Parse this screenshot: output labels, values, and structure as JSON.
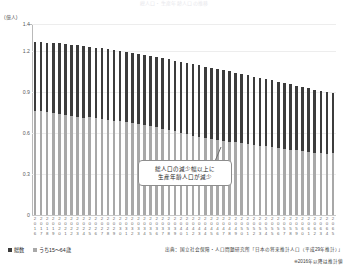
{
  "chart_title": "総人口・生産年齢人口の推移",
  "y_axis_unit": "(億人)",
  "annotation": {
    "line1": "総人口の減少幅以上に",
    "line2": "生産年齢人口が減少"
  },
  "legend": {
    "items": [
      {
        "label": "総数",
        "color": "#3c3c3c"
      },
      {
        "label": "うち15～64歳",
        "color": "#a8a8a8"
      }
    ]
  },
  "source": "出典：国立社会保障・人口問題研究所「日本の将来推計人口（平成29年推計）」",
  "note": "※2016年以降は推計値",
  "chart_data": {
    "type": "bar",
    "title": "総人口・生産年齢人口の推移",
    "xlabel": "",
    "ylabel": "(億人)",
    "ylim": [
      0,
      1.4
    ],
    "yticks": [
      0,
      0.3,
      0.6,
      0.9,
      1.2,
      1.4
    ],
    "ytick_labels": [
      "0",
      "0.3",
      "0.6",
      "0.9",
      "1.2",
      "1.4"
    ],
    "grid": true,
    "legend_position": "bottom-left",
    "categories": [
      "2016",
      "2017",
      "2018",
      "2019",
      "2020",
      "2021",
      "2022",
      "2023",
      "2024",
      "2025",
      "2026",
      "2027",
      "2028",
      "2029",
      "2030",
      "2031",
      "2032",
      "2033",
      "2034",
      "2035",
      "2036",
      "2037",
      "2038",
      "2039",
      "2040",
      "2041",
      "2042",
      "2043",
      "2044",
      "2045",
      "2046",
      "2047",
      "2048",
      "2049",
      "2050",
      "2051",
      "2052",
      "2053",
      "2054",
      "2055",
      "2056",
      "2057",
      "2058",
      "2059",
      "2060",
      "2061",
      "2062",
      "2063",
      "2064",
      "2065"
    ],
    "series": [
      {
        "name": "総数",
        "color": "#3c3c3c",
        "values": [
          1.2693,
          1.2671,
          1.2644,
          1.2612,
          1.2573,
          1.253,
          1.2484,
          1.2434,
          1.2381,
          1.2326,
          1.2268,
          1.2208,
          1.2145,
          1.208,
          1.2012,
          1.1942,
          1.187,
          1.1796,
          1.172,
          1.1643,
          1.1564,
          1.1484,
          1.1402,
          1.1319,
          1.1234,
          1.1148,
          1.1061,
          1.0973,
          1.0884,
          1.0794,
          1.0703,
          1.0612,
          1.052,
          1.0427,
          1.0334,
          1.024,
          1.0146,
          1.0052,
          0.9957,
          0.9862,
          0.9767,
          0.9672,
          0.9577,
          0.9482,
          0.9387,
          0.9292,
          0.9198,
          0.9104,
          0.901,
          0.8917
        ]
      },
      {
        "name": "うち15～64歳",
        "color": "#a8a8a8",
        "values": [
          0.7656,
          0.7596,
          0.7545,
          0.7499,
          0.7406,
          0.7341,
          0.7283,
          0.7215,
          0.7144,
          0.717,
          0.7087,
          0.7016,
          0.6951,
          0.6889,
          0.6875,
          0.6809,
          0.6745,
          0.6682,
          0.6618,
          0.6494,
          0.6417,
          0.634,
          0.6263,
          0.6188,
          0.5978,
          0.5902,
          0.5826,
          0.5751,
          0.5676,
          0.5584,
          0.5518,
          0.5453,
          0.5388,
          0.5324,
          0.5275,
          0.5214,
          0.5152,
          0.509,
          0.5028,
          0.495,
          0.4895,
          0.484,
          0.4785,
          0.473,
          0.4678,
          0.4627,
          0.4576,
          0.4525,
          0.4474,
          0.4529
        ]
      }
    ]
  }
}
